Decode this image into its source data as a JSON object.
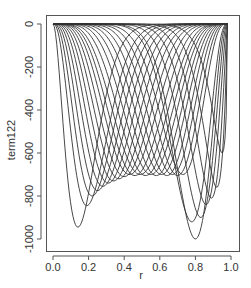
{
  "chart_data": {
    "type": "line",
    "title": "",
    "xlabel": "r",
    "ylabel": "term122",
    "xlim": [
      0.0,
      1.0
    ],
    "ylim": [
      -1050,
      30
    ],
    "xticks": [
      0.0,
      0.2,
      0.4,
      0.6,
      0.8,
      1.0
    ],
    "xtick_labels": [
      "0.0",
      "0.2",
      "0.4",
      "0.6",
      "0.8",
      "1.0"
    ],
    "yticks": [
      0,
      -200,
      -400,
      -600,
      -800,
      -1000
    ],
    "ytick_labels": [
      "0",
      "-200",
      "-400",
      "-600",
      "-800",
      "-1000"
    ],
    "grid": false,
    "legend": null,
    "line_color": "#333333",
    "x_range_of_curves": [
      0.0,
      0.98
    ],
    "series_description": "Family of ~26 U-shaped curves, each starting at 0 near r=0 and returning to 0 near r=0.98, with a single minimum at position r_min and depth min_value",
    "series": [
      {
        "name": "curve1",
        "r_min": 0.14,
        "min_value": -945
      },
      {
        "name": "curve2",
        "r_min": 0.19,
        "min_value": -845
      },
      {
        "name": "curve3",
        "r_min": 0.22,
        "min_value": -800
      },
      {
        "name": "curve4",
        "r_min": 0.25,
        "min_value": -775
      },
      {
        "name": "curve5",
        "r_min": 0.28,
        "min_value": -755
      },
      {
        "name": "curve6",
        "r_min": 0.31,
        "min_value": -740
      },
      {
        "name": "curve7",
        "r_min": 0.34,
        "min_value": -730
      },
      {
        "name": "curve8",
        "r_min": 0.37,
        "min_value": -720
      },
      {
        "name": "curve9",
        "r_min": 0.4,
        "min_value": -710
      },
      {
        "name": "curve10",
        "r_min": 0.43,
        "min_value": -700
      },
      {
        "name": "curve11",
        "r_min": 0.46,
        "min_value": -705
      },
      {
        "name": "curve12",
        "r_min": 0.49,
        "min_value": -700
      },
      {
        "name": "curve13",
        "r_min": 0.52,
        "min_value": -705
      },
      {
        "name": "curve14",
        "r_min": 0.55,
        "min_value": -700
      },
      {
        "name": "curve15",
        "r_min": 0.58,
        "min_value": -705
      },
      {
        "name": "curve16",
        "r_min": 0.61,
        "min_value": -700
      },
      {
        "name": "curve17",
        "r_min": 0.64,
        "min_value": -705
      },
      {
        "name": "curve18",
        "r_min": 0.67,
        "min_value": -700
      },
      {
        "name": "curve19",
        "r_min": 0.7,
        "min_value": -705
      },
      {
        "name": "curve20",
        "r_min": 0.73,
        "min_value": -700
      },
      {
        "name": "curve21",
        "r_min": 0.78,
        "min_value": -920
      },
      {
        "name": "curve22",
        "r_min": 0.8,
        "min_value": -1000
      },
      {
        "name": "curve23",
        "r_min": 0.83,
        "min_value": -900
      },
      {
        "name": "curve24",
        "r_min": 0.86,
        "min_value": -840
      },
      {
        "name": "curve25",
        "r_min": 0.89,
        "min_value": -810
      },
      {
        "name": "curve26",
        "r_min": 0.92,
        "min_value": -760
      },
      {
        "name": "curve27",
        "r_min": 0.95,
        "min_value": -600
      }
    ]
  }
}
